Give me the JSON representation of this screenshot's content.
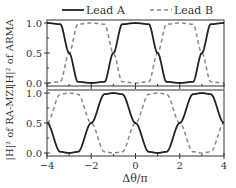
{
  "chart_data": {
    "type": "line",
    "title": "",
    "legend": {
      "position": "top",
      "entries": [
        {
          "name": "Lead A",
          "style": "solid",
          "color": "#222222"
        },
        {
          "name": "Lead B",
          "style": "dashed",
          "color": "#888888"
        }
      ]
    },
    "xlabel": "Δθ/π",
    "xlim": [
      -4,
      4
    ],
    "xticks": [
      -4,
      -2,
      0,
      2,
      4
    ],
    "xtick_labels": [
      "−4",
      "−2",
      "0",
      "2",
      "4"
    ],
    "grid": false,
    "subplots": [
      {
        "name": "ARMA",
        "ylabel": "|H|² of ARMA",
        "ylim": [
          0,
          1
        ],
        "yticks": [
          0.0,
          0.5,
          1.0
        ],
        "ytick_labels": [
          "0.0",
          "0.5",
          "1.0"
        ],
        "series": [
          {
            "name": "Lead A",
            "description": "square-like periodic transmission, period 4, high at Δθ/π in [-4,-3], [-1,1], [3,4]; crosses 0.5 at -3, -1, 1, 3",
            "x": [
              -4,
              -3.4,
              -3,
              -2.6,
              -2,
              -1.4,
              -1,
              -0.6,
              0,
              0.6,
              1,
              1.4,
              2,
              2.6,
              3,
              3.4,
              4
            ],
            "values": [
              1.0,
              0.98,
              0.5,
              0.02,
              0.0,
              0.02,
              0.5,
              0.98,
              1.0,
              0.98,
              0.5,
              0.02,
              0.0,
              0.02,
              0.5,
              0.98,
              1.0
            ]
          },
          {
            "name": "Lead B",
            "description": "complement of Lead A (1 - Lead A)",
            "x": [
              -4,
              -3.4,
              -3,
              -2.6,
              -2,
              -1.4,
              -1,
              -0.6,
              0,
              0.6,
              1,
              1.4,
              2,
              2.6,
              3,
              3.4,
              4
            ],
            "values": [
              0.0,
              0.02,
              0.5,
              0.98,
              1.0,
              0.98,
              0.5,
              0.02,
              0.0,
              0.02,
              0.5,
              0.98,
              1.0,
              0.98,
              0.5,
              0.02,
              0.0
            ]
          }
        ]
      },
      {
        "name": "RA-MZI",
        "ylabel": "|H|² of RA-MZI",
        "ylim": [
          0,
          1
        ],
        "yticks": [
          0.0,
          0.5,
          1.0
        ],
        "ytick_labels": [
          "0.0",
          "0.5",
          "1.0"
        ],
        "series": [
          {
            "name": "Lead A",
            "description": "high at Δθ/π in [-2,0] and [2,4]; crosses 0.5 at -4, -2, 0, 2, 4",
            "x": [
              -4,
              -3.4,
              -3,
              -2.6,
              -2,
              -1.4,
              -1,
              -0.6,
              0,
              0.6,
              1,
              1.4,
              2,
              2.6,
              3,
              3.4,
              4
            ],
            "values": [
              0.5,
              0.02,
              0.0,
              0.02,
              0.5,
              0.98,
              1.0,
              0.98,
              0.5,
              0.02,
              0.0,
              0.02,
              0.5,
              0.98,
              1.0,
              0.98,
              0.5
            ]
          },
          {
            "name": "Lead B",
            "description": "complement of Lead A",
            "x": [
              -4,
              -3.4,
              -3,
              -2.6,
              -2,
              -1.4,
              -1,
              -0.6,
              0,
              0.6,
              1,
              1.4,
              2,
              2.6,
              3,
              3.4,
              4
            ],
            "values": [
              0.5,
              0.98,
              1.0,
              0.98,
              0.5,
              0.02,
              0.0,
              0.02,
              0.5,
              0.98,
              1.0,
              0.98,
              0.5,
              0.02,
              0.0,
              0.02,
              0.5
            ]
          }
        ]
      }
    ]
  }
}
